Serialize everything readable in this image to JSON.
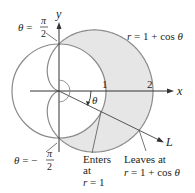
{
  "figure": {
    "axes": {
      "x_label": "x",
      "y_label": "y",
      "tick_1": "1",
      "tick_2": "2"
    },
    "curves": {
      "circle": {
        "equation": "r = 1"
      },
      "cardioid": {
        "equation_label": "r = 1 + cos θ",
        "lhs": "r",
        "rhs": " = 1 + cos ",
        "theta": "θ"
      }
    },
    "angle_labels": {
      "top": {
        "theta": "θ",
        "eq": " = ",
        "num": "π",
        "den": "2"
      },
      "bottom": {
        "theta": "θ",
        "eq": " = −",
        "num": "π",
        "den": "2"
      },
      "ray_angle": "θ"
    },
    "ray": {
      "label": "L",
      "angle_deg": -26
    },
    "annotations": {
      "enters": {
        "line1": "Enters",
        "line2": "at",
        "line3_var": "r",
        "line3_rest": " = 1"
      },
      "leaves": {
        "line1": "Leaves at",
        "line2_var": "r",
        "line2_rest": " = 1 + cos ",
        "line2_theta": "θ"
      }
    },
    "colors": {
      "stroke": "#8a8a8a",
      "axis": "#333333",
      "shade": "#e6e6e6",
      "text": "#231f20"
    }
  }
}
